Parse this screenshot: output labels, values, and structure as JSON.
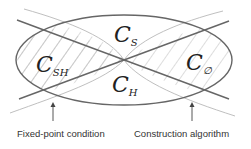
{
  "diagram": {
    "regions": [
      {
        "id": "cs",
        "symbol": "C",
        "subscript": "S",
        "x": 114,
        "y": 42
      },
      {
        "id": "csh",
        "symbol": "C",
        "subscript": "SH",
        "x": 38,
        "y": 71
      },
      {
        "id": "ch",
        "symbol": "C",
        "subscript": "H",
        "x": 114,
        "y": 91
      },
      {
        "id": "cempty",
        "symbol": "C",
        "subscript": "∅",
        "x": 186,
        "y": 71
      }
    ],
    "annotations": [
      {
        "id": "fixed-point",
        "label": "Fixed-point condition"
      },
      {
        "id": "construction",
        "label": "Construction algorithm"
      }
    ],
    "colors": {
      "ellipse": "#666666",
      "dark_line": "#666666",
      "light_line": "#b0b0b0",
      "hatch": "#aaaaaa",
      "arrow": "#444444",
      "text": "#222222"
    }
  }
}
